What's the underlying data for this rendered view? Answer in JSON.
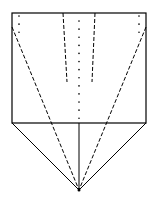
{
  "diagram": {
    "type": "fold-diagram",
    "colors": {
      "stroke": "#000000",
      "background": "#ffffff"
    },
    "rectangle": {
      "x": 12,
      "y": 13,
      "width": 134,
      "height": 110
    },
    "apex": {
      "x": 79,
      "y": 190
    },
    "solid_lines": [
      {
        "x1": 12,
        "y1": 123,
        "x2": 79,
        "y2": 190
      },
      {
        "x1": 146,
        "y1": 123,
        "x2": 79,
        "y2": 190
      },
      {
        "x1": 79,
        "y1": 123,
        "x2": 79,
        "y2": 190
      }
    ],
    "dashed_lines": [
      {
        "x1": 63,
        "y1": 13,
        "x2": 67,
        "y2": 82
      },
      {
        "x1": 95,
        "y1": 13,
        "x2": 92,
        "y2": 82
      },
      {
        "x1": 12,
        "y1": 27,
        "x2": 79,
        "y2": 190
      },
      {
        "x1": 146,
        "y1": 27,
        "x2": 79,
        "y2": 190
      }
    ],
    "dotted_lines": [
      {
        "x1": 79,
        "y1": 21,
        "x2": 79,
        "y2": 120
      },
      {
        "x1": 19,
        "y1": 16,
        "x2": 19,
        "y2": 34
      },
      {
        "x1": 139,
        "y1": 16,
        "x2": 139,
        "y2": 34
      }
    ]
  }
}
